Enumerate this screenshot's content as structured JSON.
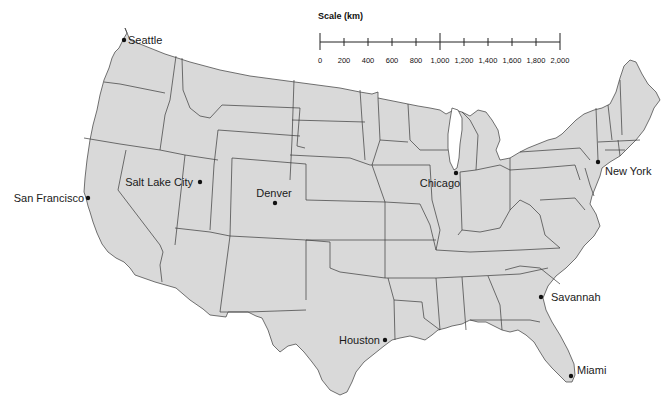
{
  "map": {
    "title": "Map of the contiguous United States",
    "land_color": "#d9d9d9",
    "border_color": "#3a3a3a",
    "background_color": "#ffffff"
  },
  "scale": {
    "title": "Scale (km)",
    "ticks": [
      "0",
      "200",
      "400",
      "600",
      "800",
      "1,000",
      "1,200",
      "1,400",
      "1,600",
      "1,800",
      "2,000"
    ],
    "major_ticks": [
      "0",
      "1,000",
      "2,000"
    ]
  },
  "cities": [
    {
      "name": "Seattle",
      "x": 124,
      "y": 40,
      "label_side": "right"
    },
    {
      "name": "San Francisco",
      "x": 88,
      "y": 198,
      "label_side": "left"
    },
    {
      "name": "Salt Lake City",
      "x": 200,
      "y": 182,
      "label_side": "left"
    },
    {
      "name": "Denver",
      "x": 275,
      "y": 203,
      "label_side": "above"
    },
    {
      "name": "Chicago",
      "x": 456,
      "y": 173,
      "label_side": "below-left"
    },
    {
      "name": "New York",
      "x": 598,
      "y": 162,
      "label_side": "below-right"
    },
    {
      "name": "Savannah",
      "x": 541,
      "y": 297,
      "label_side": "right"
    },
    {
      "name": "Houston",
      "x": 385,
      "y": 340,
      "label_side": "left"
    },
    {
      "name": "Miami",
      "x": 571,
      "y": 376,
      "label_side": "right"
    }
  ]
}
